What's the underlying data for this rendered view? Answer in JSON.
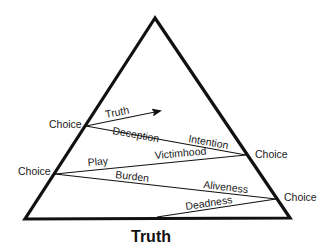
{
  "diagram": {
    "type": "triangle-zigzag",
    "base_label": "Truth",
    "choice_points": [
      {
        "label": "Choice",
        "side": "left"
      },
      {
        "label": "Choice",
        "side": "right"
      },
      {
        "label": "Choice",
        "side": "left"
      },
      {
        "label": "Choice",
        "side": "right"
      }
    ],
    "path_labels": {
      "arrow_truth": "Truth",
      "deception": "Deception",
      "intention": "Intention",
      "play": "Play",
      "victimhood": "Victimhood",
      "burden": "Burden",
      "aliveness": "Aliveness",
      "deadness": "Deadness"
    },
    "colors": {
      "stroke": "#111111",
      "background": "#ffffff"
    }
  }
}
